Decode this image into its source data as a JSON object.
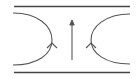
{
  "diagram": {
    "width": 139,
    "height": 79,
    "stroke_color": "#555555",
    "line_color": "#444444",
    "background": "#ffffff",
    "elements": {
      "top_wall": {
        "x1": 14,
        "y1": 6.5,
        "x2": 130,
        "y2": 6.5
      },
      "bottom_wall": {
        "x1": 14,
        "y1": 72.5,
        "x2": 130,
        "y2": 72.5
      },
      "left_arc": {
        "d": "M13,13 C38,13 52,26 52,40 C52,54 38,65 13,65",
        "arrow_at": [
          52,
          43
        ],
        "arrow_direction": "up"
      },
      "right_arc": {
        "d": "M130,14 C105,14 91,27 91,40 C91,53 105,64 130,64",
        "arrow_at": [
          91,
          43
        ],
        "arrow_direction": "up"
      },
      "center_arrow": {
        "x": 72,
        "y_start": 60,
        "y_end": 20,
        "direction": "up"
      }
    }
  }
}
